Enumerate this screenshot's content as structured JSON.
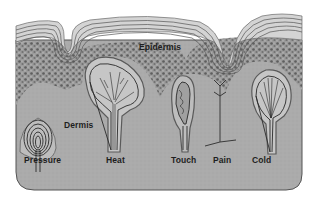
{
  "diagram": {
    "colors": {
      "background": "#ffffff",
      "dermis_fill": "#a9a9a9",
      "epidermis_fill": "#cfcfcf",
      "granular_layer": "#7a7a7a",
      "outline": "#2a2a2a",
      "label_text": "#1e1e1e"
    },
    "layers": {
      "epidermis": "Epidermis",
      "dermis": "Dermis"
    },
    "receptors": [
      {
        "id": "pressure",
        "label": "Pressure"
      },
      {
        "id": "heat",
        "label": "Heat"
      },
      {
        "id": "touch",
        "label": "Touch"
      },
      {
        "id": "pain",
        "label": "Pain"
      },
      {
        "id": "cold",
        "label": "Cold"
      }
    ]
  }
}
